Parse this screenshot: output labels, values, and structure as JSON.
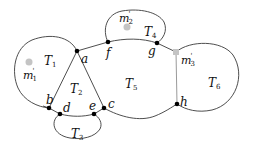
{
  "diagram": {
    "vertices": [
      {
        "id": "a",
        "label": "a",
        "x": 77,
        "y": 51
      },
      {
        "id": "f",
        "label": "f",
        "x": 108,
        "y": 42
      },
      {
        "id": "g",
        "label": "g",
        "x": 157,
        "y": 43
      },
      {
        "id": "h",
        "label": "h",
        "x": 177,
        "y": 104
      },
      {
        "id": "b",
        "label": "b",
        "x": 49,
        "y": 108
      },
      {
        "id": "d",
        "label": "d",
        "x": 60,
        "y": 114
      },
      {
        "id": "e",
        "label": "e",
        "x": 94,
        "y": 114
      },
      {
        "id": "c",
        "label": "c",
        "x": 104,
        "y": 108
      }
    ],
    "regions": [
      {
        "id": "T1",
        "symbol": "T",
        "sub": "1"
      },
      {
        "id": "T2",
        "symbol": "T",
        "sub": "2"
      },
      {
        "id": "T3",
        "symbol": "T",
        "sub": "3"
      },
      {
        "id": "T4",
        "symbol": "T",
        "sub": "4"
      },
      {
        "id": "T5",
        "symbol": "T",
        "sub": "5"
      },
      {
        "id": "T6",
        "symbol": "T",
        "sub": "6"
      }
    ],
    "marks": [
      {
        "id": "m1",
        "symbol": "m",
        "sub": "1",
        "prime": "'",
        "shape": "circle"
      },
      {
        "id": "m2",
        "symbol": "m",
        "sub": "2",
        "prime": "'",
        "shape": "circle"
      },
      {
        "id": "m3",
        "symbol": "m",
        "sub": "3",
        "prime": "'",
        "shape": "square"
      }
    ],
    "colors": {
      "edge": "#3a3a3a",
      "vertex": "#000000",
      "mark": "#c4c4c4",
      "gray_edge": "#9a9a9a"
    }
  }
}
